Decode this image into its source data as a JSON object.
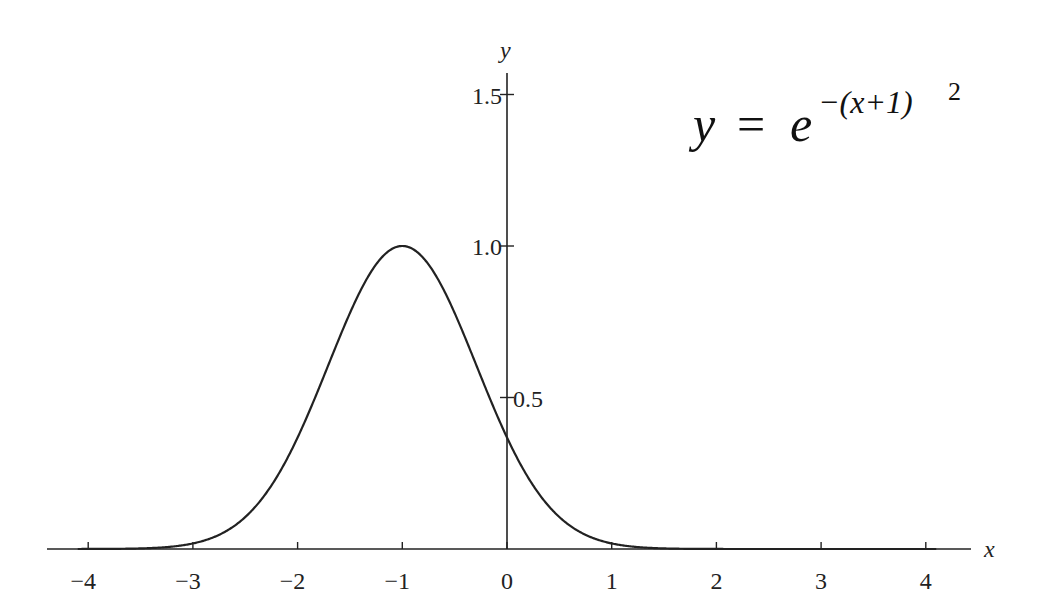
{
  "chart_data": {
    "type": "line",
    "title": "",
    "annotation": "y = e^{-(x+1)^2}",
    "xlabel": "x",
    "ylabel": "y",
    "xlim": [
      -4.4,
      4.4
    ],
    "ylim": [
      0,
      1.6
    ],
    "xticks": [
      -4,
      -3,
      -2,
      -1,
      0,
      1,
      2,
      3,
      4
    ],
    "xtick_labels": [
      "−4",
      "−3",
      "−2",
      "−1",
      "0",
      "1",
      "2",
      "3",
      "4"
    ],
    "yticks": [
      0.5,
      1.0,
      1.5
    ],
    "ytick_labels": [
      "0.5",
      "1.0",
      "1.5"
    ],
    "grid": false,
    "legend": null,
    "series": [
      {
        "name": "y = e^{-(x+1)^2}",
        "x": [
          -4,
          -3.5,
          -3,
          -2.5,
          -2,
          -1.5,
          -1,
          -0.5,
          0,
          0.5,
          1,
          1.5,
          2,
          2.5,
          3,
          3.5,
          4
        ],
        "values": [
          0.0001,
          0.0019,
          0.0183,
          0.1054,
          0.3679,
          0.7788,
          1.0,
          0.7788,
          0.3679,
          0.1054,
          0.0183,
          0.0019,
          0.0001,
          0.0,
          0.0,
          0.0,
          0.0
        ]
      }
    ]
  },
  "labels": {
    "x_axis": "x",
    "y_axis": "y",
    "formula_y": "y",
    "formula_eq": "=",
    "formula_e": "e",
    "formula_exp": "−(x+1)",
    "formula_sq": "2"
  }
}
